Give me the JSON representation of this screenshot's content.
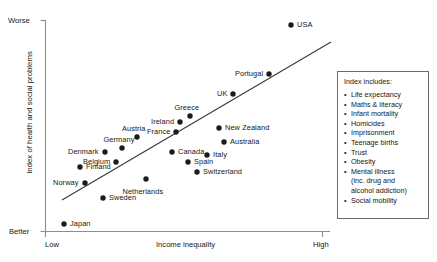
{
  "chart_data": {
    "type": "scatter",
    "title": "",
    "xlabel": "Income inequality",
    "ylabel": "Index of health and social problems",
    "x_ticklabels": [
      "Low",
      "High"
    ],
    "y_ticklabels": [
      "Worse",
      "Better"
    ],
    "xlim": [
      0,
      100
    ],
    "ylim": [
      0,
      100
    ],
    "grid": false,
    "legend_position": "right",
    "trendline": {
      "x0": 62,
      "y0": 200,
      "x1": 331,
      "y1": 42
    },
    "points": [
      {
        "name": "USA",
        "px": 291,
        "py": 25,
        "label_dx": 6,
        "label_dy": -4,
        "align": "left"
      },
      {
        "name": "Portugal",
        "px": 269,
        "py": 74,
        "label_dx": -6,
        "label_dy": -4,
        "align": "right"
      },
      {
        "name": "UK",
        "px": 233,
        "py": 94,
        "label_dx": -6,
        "label_dy": -4,
        "align": "right"
      },
      {
        "name": "Greece",
        "px": 190,
        "py": 116,
        "label_dx": -3,
        "label_dy": -12,
        "align": "center"
      },
      {
        "name": "New Zealand",
        "px": 219,
        "py": 128,
        "label_dx": 6,
        "label_dy": -4,
        "align": "left"
      },
      {
        "name": "Ireland",
        "px": 180,
        "py": 122,
        "label_dx": -6,
        "label_dy": -4,
        "align": "right"
      },
      {
        "name": "France",
        "px": 176,
        "py": 132,
        "label_dx": -6,
        "label_dy": -4,
        "align": "right"
      },
      {
        "name": "Australia",
        "px": 224,
        "py": 142,
        "label_dx": 6,
        "label_dy": -4,
        "align": "left"
      },
      {
        "name": "Austria",
        "px": 137,
        "py": 137,
        "label_dx": -3,
        "label_dy": -12,
        "align": "center"
      },
      {
        "name": "Germany",
        "px": 122,
        "py": 148,
        "label_dx": -3,
        "label_dy": -12,
        "align": "center"
      },
      {
        "name": "Canada",
        "px": 172,
        "py": 152,
        "label_dx": 6,
        "label_dy": -4,
        "align": "left"
      },
      {
        "name": "Denmark",
        "px": 105,
        "py": 152,
        "label_dx": -6,
        "label_dy": -4,
        "align": "right"
      },
      {
        "name": "Italy",
        "px": 207,
        "py": 155,
        "label_dx": 6,
        "label_dy": -4,
        "align": "left"
      },
      {
        "name": "Spain",
        "px": 188,
        "py": 162,
        "label_dx": 6,
        "label_dy": -4,
        "align": "left"
      },
      {
        "name": "Belgium",
        "px": 116,
        "py": 162,
        "label_dx": -6,
        "label_dy": -4,
        "align": "right"
      },
      {
        "name": "Finland",
        "px": 80,
        "py": 167,
        "label_dx": 6,
        "label_dy": -4,
        "align": "left"
      },
      {
        "name": "Switzerland",
        "px": 197,
        "py": 172,
        "label_dx": 6,
        "label_dy": -4,
        "align": "left"
      },
      {
        "name": "Netherlands",
        "px": 146,
        "py": 179,
        "label_dx": -3,
        "label_dy": 9,
        "align": "center"
      },
      {
        "name": "Norway",
        "px": 85,
        "py": 183,
        "label_dx": -6,
        "label_dy": -4,
        "align": "right"
      },
      {
        "name": "Sweden",
        "px": 103,
        "py": 198,
        "label_dx": 6,
        "label_dy": -4,
        "align": "left"
      },
      {
        "name": "Japan",
        "px": 64,
        "py": 224,
        "label_dx": 6,
        "label_dy": -4,
        "align": "left"
      }
    ],
    "annotation_colors": {
      "dot": "#1c1c1c",
      "line": "#3a3a3a",
      "axis": "#8e8e8e"
    }
  },
  "legend": {
    "title": "Index includes:",
    "items": [
      "Life expectancy",
      "Maths & literacy",
      "Infant mortality",
      "Homicides",
      "Imprisonment",
      "Teenage births",
      "Trust",
      "Obesity",
      "Mental illness\n(inc. drug and\nalcohol addiction)",
      "Social mobility"
    ]
  },
  "axes": {
    "y_top_label": "Worse",
    "y_bottom_label": "Better",
    "y_title": "Index of health and social problems",
    "x_left_label": "Low",
    "x_right_label": "High",
    "x_title": "Income inequality"
  }
}
